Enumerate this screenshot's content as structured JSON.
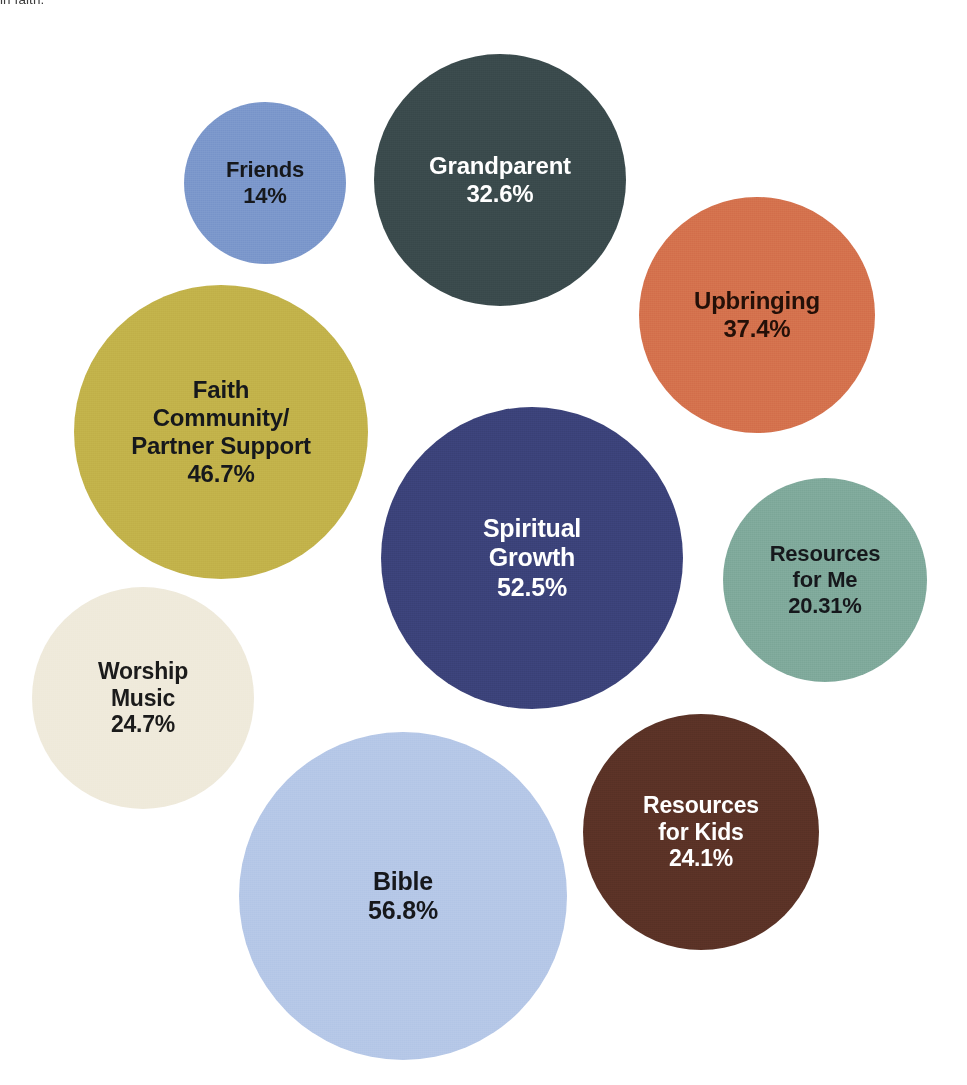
{
  "caption": {
    "fragment_text": "in faith."
  },
  "chart_data": {
    "type": "bubble",
    "title": "",
    "subtitle": "",
    "xlabel": "",
    "ylabel": "",
    "grid": false,
    "legend_position": "none",
    "value_suffix": "%",
    "background_color": "#ffffff",
    "note": "Packed bubble chart; bubble area encodes the percentage value. Labels are printed inside each bubble.",
    "categories": [
      "Bible",
      "Spiritual Growth",
      "Faith Community/\nPartner Support",
      "Upbringing",
      "Grandparent",
      "Worship Music",
      "Resources for Kids",
      "Resources for Me",
      "Friends"
    ],
    "values": [
      56.8,
      52.5,
      46.7,
      37.4,
      32.6,
      24.7,
      24.1,
      20.31,
      14
    ],
    "value_labels": [
      "56.8%",
      "52.5%",
      "46.7%",
      "37.4%",
      "32.6%",
      "24.7%",
      "24.1%",
      "20.31%",
      "14%"
    ],
    "colors": [
      "#b5c7e7",
      "#3b4279",
      "#c2b24a",
      "#d4714d",
      "#3a4a4c",
      "#efeadb",
      "#5a3226",
      "#7fa99b",
      "#7b97cb"
    ],
    "bubbles": [
      {
        "id": "bible",
        "label": "Bible",
        "value": 56.8,
        "value_label": "56.8%",
        "color": "#b5c7e7",
        "text_color": "#16181c",
        "cx": 403,
        "cy": 896,
        "diameter": 328,
        "font_size": 25
      },
      {
        "id": "spiritual-growth",
        "label": "Spiritual\nGrowth",
        "value": 52.5,
        "value_label": "52.5%",
        "color": "#3b4279",
        "text_color": "#ffffff",
        "cx": 532,
        "cy": 558,
        "diameter": 302,
        "font_size": 25
      },
      {
        "id": "faith-community-partner-support",
        "label": "Faith\nCommunity/\nPartner Support",
        "value": 46.7,
        "value_label": "46.7%",
        "color": "#c2b24a",
        "text_color": "#16181c",
        "cx": 221,
        "cy": 432,
        "diameter": 294,
        "font_size": 24
      },
      {
        "id": "upbringing",
        "label": "Upbringing",
        "value": 37.4,
        "value_label": "37.4%",
        "color": "#d4714d",
        "text_color": "#241008",
        "cx": 757,
        "cy": 315,
        "diameter": 236,
        "font_size": 24
      },
      {
        "id": "grandparent",
        "label": "Grandparent",
        "value": 32.6,
        "value_label": "32.6%",
        "color": "#3a4a4c",
        "text_color": "#ffffff",
        "cx": 500,
        "cy": 180,
        "diameter": 252,
        "font_size": 24
      },
      {
        "id": "worship-music",
        "label": "Worship\nMusic",
        "value": 24.7,
        "value_label": "24.7%",
        "color": "#efeadb",
        "text_color": "#1b1b1b",
        "cx": 143,
        "cy": 698,
        "diameter": 222,
        "font_size": 23
      },
      {
        "id": "resources-for-kids",
        "label": "Resources\nfor Kids",
        "value": 24.1,
        "value_label": "24.1%",
        "color": "#5a3226",
        "text_color": "#ffffff",
        "cx": 701,
        "cy": 832,
        "diameter": 236,
        "font_size": 23
      },
      {
        "id": "resources-for-me",
        "label": "Resources\nfor Me",
        "value": 20.31,
        "value_label": "20.31%",
        "color": "#7fa99b",
        "text_color": "#16181c",
        "cx": 825,
        "cy": 580,
        "diameter": 204,
        "font_size": 22
      },
      {
        "id": "friends",
        "label": "Friends",
        "value": 14,
        "value_label": "14%",
        "color": "#7b97cb",
        "text_color": "#16181c",
        "cx": 265,
        "cy": 183,
        "diameter": 162,
        "font_size": 22
      }
    ]
  }
}
